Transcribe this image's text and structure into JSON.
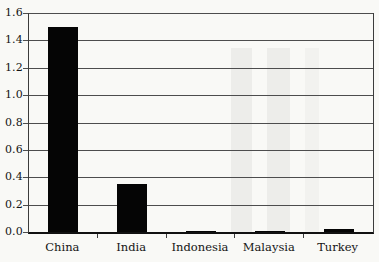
{
  "chart_data": {
    "type": "bar",
    "categories": [
      "China",
      "India",
      "Indonesia",
      "Malaysia",
      "Turkey"
    ],
    "values": [
      1.5,
      0.35,
      0.01,
      0.005,
      0.02
    ],
    "title": "",
    "xlabel": "",
    "ylabel": "",
    "ylim": [
      0,
      1.6
    ],
    "ytick_step": 0.2,
    "ytick_labels": [
      "0.0",
      "0.2",
      "0.4",
      "0.6",
      "0.8",
      "1.0",
      "1.2",
      "1.4",
      "1.6"
    ],
    "grid": true,
    "legend_position": "none",
    "bar_color": "#050505",
    "gridline_color": "#4d4d4d",
    "background_color": "#f9f9f6",
    "text_color": "#141414"
  }
}
